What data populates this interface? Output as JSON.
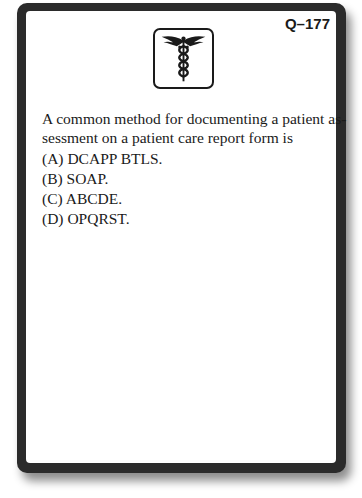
{
  "card": {
    "question_number": "Q–177",
    "emblem_icon": "caduceus-icon",
    "question": {
      "stem": "A common method for documenting a patient as-sessment on a patient care report form is",
      "stem_line1": "A common method for documenting a patient as-",
      "stem_line2": "sessment on a patient care report form is",
      "options": [
        {
          "label": "(A)",
          "text": "DCAPP BTLS."
        },
        {
          "label": "(B)",
          "text": "SOAP."
        },
        {
          "label": "(C)",
          "text": "ABCDE."
        },
        {
          "label": "(D)",
          "text": "OPQRST."
        }
      ]
    }
  },
  "colors": {
    "card_border": "#2b2b2b",
    "card_face": "#ffffff",
    "text": "#1a1a1a"
  }
}
